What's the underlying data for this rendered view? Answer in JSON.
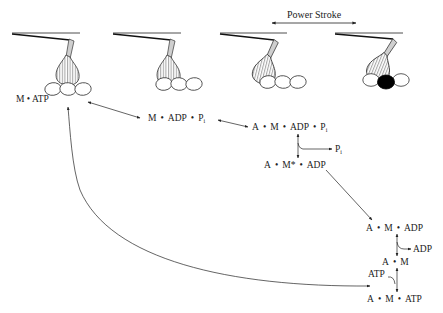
{
  "diagram": {
    "power_stroke_label": "Power Stroke",
    "colors": {
      "line": "#222222",
      "head_fill": "#cfcfcf",
      "actin_bound": "#000000",
      "background": "#ffffff"
    },
    "states": [
      {
        "id": "m_atp",
        "parts": [
          "M",
          "ATP"
        ],
        "label": "M • ATP"
      },
      {
        "id": "m_adp_pi",
        "parts": [
          "M",
          "ADP",
          "P"
        ],
        "subscript": "i",
        "label": "M • ADP • Pi"
      },
      {
        "id": "a_m_adp_pi",
        "parts": [
          "A",
          "M",
          "ADP",
          "P"
        ],
        "subscript": "i",
        "label": "A • M • ADP • Pi"
      },
      {
        "id": "a_mstar_adp",
        "parts": [
          "A",
          "M*",
          "ADP"
        ],
        "label": "A • M* • ADP"
      },
      {
        "id": "a_m_adp",
        "parts": [
          "A",
          "M",
          "ADP"
        ],
        "label": "A • M • ADP"
      },
      {
        "id": "a_m",
        "parts": [
          "A",
          "M"
        ],
        "label": "A • M"
      },
      {
        "id": "a_m_atp",
        "parts": [
          "A",
          "M",
          "ATP"
        ],
        "label": "A • M • ATP"
      }
    ],
    "releases": [
      {
        "from": "a_m_adp_pi",
        "to": "a_mstar_adp",
        "product": "P",
        "subscript": "i",
        "direction": "out"
      },
      {
        "from": "a_m_adp",
        "to": "a_m",
        "product": "ADP",
        "direction": "out"
      },
      {
        "from": "a_m",
        "to": "a_m_atp",
        "product": "ATP",
        "direction": "in"
      }
    ],
    "transitions": [
      {
        "from": "m_atp",
        "to": "m_adp_pi",
        "type": "reversible"
      },
      {
        "from": "m_adp_pi",
        "to": "a_m_adp_pi",
        "type": "reversible"
      },
      {
        "from": "a_m_adp_pi",
        "to": "a_mstar_adp",
        "type": "reversible"
      },
      {
        "from": "a_mstar_adp",
        "to": "a_m_adp",
        "type": "forward"
      },
      {
        "from": "a_m_adp",
        "to": "a_m",
        "type": "reversible"
      },
      {
        "from": "a_m",
        "to": "a_m_atp",
        "type": "reversible"
      },
      {
        "from": "a_m_atp",
        "to": "m_atp",
        "type": "reversible-curved"
      }
    ],
    "myosin_panels": [
      {
        "index": 1,
        "head_angle": "pre-stroke",
        "actin_bound": false
      },
      {
        "index": 2,
        "head_angle": "pre-stroke",
        "actin_bound": false
      },
      {
        "index": 3,
        "head_angle": "upright",
        "actin_bound": false
      },
      {
        "index": 4,
        "head_angle": "post-stroke",
        "actin_bound": true
      }
    ]
  }
}
